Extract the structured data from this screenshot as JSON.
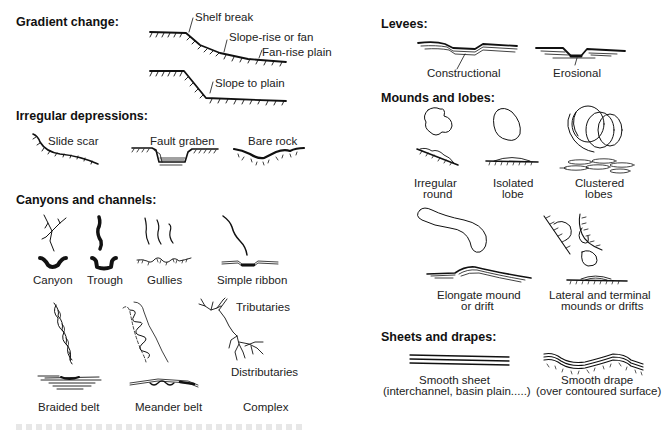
{
  "left_column": {
    "gradient_change": {
      "heading": "Gradient change:",
      "labels": {
        "shelf_break": "Shelf break",
        "slope_rise": "Slope-rise or fan",
        "fan_rise_plain": "Fan-rise plain",
        "slope_to_plain": "Slope to plain"
      }
    },
    "irregular_depressions": {
      "heading": "Irregular depressions:",
      "items": [
        "Slide scar",
        "Fault graben",
        "Bare rock"
      ]
    },
    "canyons_and_channels": {
      "heading": "Canyons and channels:",
      "items": [
        "Canyon",
        "Trough",
        "Gullies",
        "Simple ribbon",
        "Braided belt",
        "Meander belt",
        "Complex"
      ],
      "complex_labels": {
        "tributaries": "Tributaries",
        "distributaries": "Distributaries"
      }
    }
  },
  "right_column": {
    "levees": {
      "heading": "Levees:",
      "items": [
        "Constructional",
        "Erosional"
      ]
    },
    "mounds_and_lobes": {
      "heading": "Mounds and lobes:",
      "items": [
        {
          "line1": "Irregular",
          "line2": "round"
        },
        {
          "line1": "Isolated",
          "line2": "lobe"
        },
        {
          "line1": "Clustered",
          "line2": "lobes"
        },
        {
          "line1": "Elongate mound",
          "line2": "or drift"
        },
        {
          "line1": "Lateral and terminal",
          "line2": "mounds or drifts"
        }
      ]
    },
    "sheets_and_drapes": {
      "heading": "Sheets and drapes:",
      "items": [
        {
          "line1": "Smooth sheet",
          "line2": "(interchannel, basin plain.....)"
        },
        {
          "line1": "Smooth drape",
          "line2": "(over contoured surface)"
        }
      ]
    }
  }
}
